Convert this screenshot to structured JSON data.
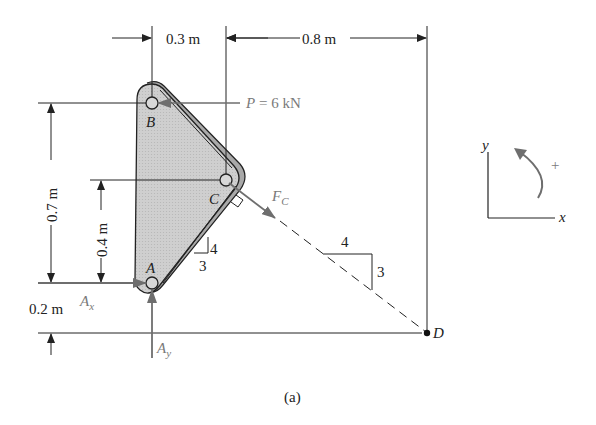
{
  "diagram": {
    "caption": "(a)",
    "dimensions": {
      "top_left": "0.3 m",
      "top_right": "0.8 m",
      "left_outer": "0.7 m",
      "left_inner": "0.4 m",
      "bottom_left": "0.2 m"
    },
    "points": {
      "A": "A",
      "B": "B",
      "C": "C",
      "D": "D"
    },
    "forces": {
      "P": {
        "symbol": "P",
        "equals": " = 6 kN"
      },
      "Fc": {
        "symbol": "F",
        "sub": "C"
      },
      "Ax": {
        "symbol": "A",
        "sub": "x"
      },
      "Ay": {
        "symbol": "A",
        "sub": "y"
      }
    },
    "slopes": {
      "plate": {
        "rise": "4",
        "run": "3"
      },
      "line": {
        "run": "4",
        "rise": "3"
      }
    },
    "axes": {
      "x": "x",
      "y": "y",
      "rotation_sign": "+"
    },
    "colors": {
      "plate_fill": "#c8c8c8",
      "plate_edge": "#a8a8a8",
      "line": "#222222",
      "force": "#7a7a7a"
    }
  }
}
